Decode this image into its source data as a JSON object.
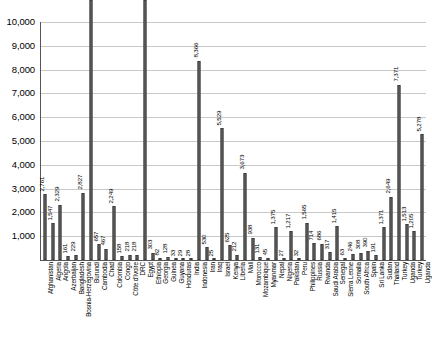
{
  "chart_data": {
    "type": "bar",
    "title": "",
    "subtitle": "",
    "xlabel": "",
    "ylabel": "",
    "ylim": [
      0,
      10000
    ],
    "ytick_step": 1000,
    "grid": true,
    "legend": "none",
    "orientation": "vertical",
    "value_labels_rotated": true,
    "category_labels_rotated": true,
    "ytick_labels": [
      "10,000",
      "9,000",
      "8,000",
      "7,000",
      "6,000",
      "5,000",
      "4,000",
      "3,000",
      "2,000",
      "1,000",
      "0"
    ],
    "ytick_values": [
      10000,
      9000,
      8000,
      7000,
      6000,
      5000,
      4000,
      3000,
      2000,
      1000,
      0
    ],
    "categories": [
      "Afghanistan",
      "Algeria",
      "Angola",
      "Azerbaijan",
      "Bangladesh",
      "Bosnia-Herzegovina",
      "Burundi",
      "Cambodia",
      "Chad",
      "Colombia",
      "Congo",
      "Côte d'Ivoire",
      "DRC",
      "Egypt",
      "Ethiopia",
      "Georgia",
      "Guinea",
      "Guyana",
      "Honduras",
      "India",
      "Indonesia",
      "Iran",
      "Iraq",
      "Israel",
      "Kenya",
      "Liberia",
      "Mali",
      "Morocco",
      "Mozambique",
      "Myanmar",
      "Nepal",
      "Nigeria",
      "Pakistan",
      "Peru",
      "Philippines",
      "Russia",
      "Rwanda",
      "Saudi Arabia",
      "Senegal",
      "Sierra Leone",
      "Somalia",
      "South Africa",
      "Spain",
      "Sri Lanka",
      "Sudan",
      "Thailand",
      "Turkey",
      "Uganda"
    ],
    "values": [
      2761,
      1547,
      2329,
      161,
      229,
      2827,
      12623,
      657,
      467,
      2249,
      158,
      218,
      218,
      10909,
      303,
      82,
      128,
      33,
      29,
      28,
      8366,
      530,
      25,
      5529,
      625,
      212,
      3673,
      938,
      131,
      45,
      1375,
      27,
      1217,
      32,
      1565,
      714,
      686,
      317,
      1415,
      63,
      246,
      308,
      390,
      191,
      1371,
      2649,
      7371,
      1513
    ],
    "value_labels": [
      "2,761",
      "1,547",
      "2,329",
      "161",
      "229",
      "2,827",
      "12,623",
      "657",
      "467",
      "2,249",
      "158",
      "218",
      "218",
      "10,909",
      "303",
      "82",
      "128",
      "33",
      "29",
      "28",
      "8,366",
      "530",
      "25",
      "5,529",
      "625",
      "212",
      "3,673",
      "938",
      "131",
      "45",
      "1,375",
      "27",
      "1,217",
      "32",
      "1,565",
      "714",
      "686",
      "317",
      "1,415",
      "63",
      "246",
      "308",
      "390",
      "191",
      "1,371",
      "2,649",
      "7,371",
      "1,513"
    ],
    "extra_categories": [
      "Turkey",
      "Uganda"
    ],
    "extra_values": [
      1205,
      5278
    ],
    "extra_value_labels": [
      "1,205",
      "5,278"
    ],
    "colors": {
      "bar_fill": "#6b6b6b",
      "bar_stroke": "#3d3d3d",
      "gridline": "#c9c9c9",
      "axis": "#555555",
      "text": "#000000",
      "background": "#ffffff"
    }
  }
}
